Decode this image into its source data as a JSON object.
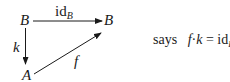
{
  "diagram": {
    "nodes": {
      "top_left": "B",
      "top_right": "B",
      "bottom_left": "A"
    },
    "arrows": {
      "top": {
        "label_main": "id",
        "label_sub": "B",
        "from": "B",
        "to": "B"
      },
      "left": {
        "label": "k",
        "from": "B",
        "to": "A"
      },
      "diagonal": {
        "label": "f",
        "from": "A",
        "to": "B"
      }
    }
  },
  "caption": {
    "prefix": "says",
    "f": "f",
    "dot": "·",
    "k": "k",
    "eq": "=",
    "id": "id",
    "sub": "B",
    "end": "."
  }
}
